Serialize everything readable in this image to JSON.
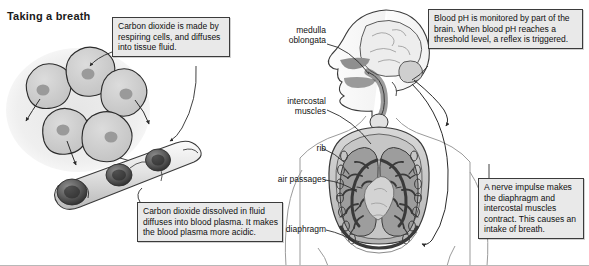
{
  "figure": {
    "title": "Taking a breath",
    "topic": "human breathing reflex and carbon dioxide transport",
    "style": "grayscale textbook illustration"
  },
  "callouts": [
    {
      "id": "co2-cells",
      "text": "Carbon dioxide is made by respiring cells, and diffuses into tissue fluid.",
      "points_to": "respiring-tissue-cells"
    },
    {
      "id": "blood-ph",
      "text": "Blood pH is monitored by part of the brain. When blood pH reaches a threshold level, a reflex is triggered.",
      "points_to": "medulla-oblongata"
    },
    {
      "id": "co2-plasma",
      "text": "Carbon dioxide dissolved in fluid diffuses into blood plasma. It makes the blood plasma more acidic.",
      "points_to": "blood-vessel"
    },
    {
      "id": "nerve-impulse",
      "text": "A nerve impulse makes the diaphragm and intercostal muscles contract. This causes an intake of breath.",
      "points_to": "diaphragm-and-intercostal-muscles"
    }
  ],
  "anatomy_labels": [
    {
      "id": "medulla",
      "text": "medulla\noblongata"
    },
    {
      "id": "intercostal",
      "text": "intercostal\nmuscles"
    },
    {
      "id": "rib",
      "text": "rib"
    },
    {
      "id": "air-passages",
      "text": "air passages"
    },
    {
      "id": "diaphragm",
      "text": "diaphragm"
    }
  ],
  "illustrations": [
    {
      "id": "tissue-cells",
      "description": "cluster of five respiring cells with nuclei in tissue fluid, arrows showing carbon dioxide diffusing out"
    },
    {
      "id": "blood-vessel",
      "description": "cutaway blood vessel containing red blood cells"
    },
    {
      "id": "human-torso",
      "description": "human head and torso in profile showing brain, nasal cavity, trachea, ribs, lungs, heart and diaphragm"
    }
  ],
  "colors": {
    "callout_fill": "#e9e9e9",
    "callout_border": "#3b3b3b",
    "ink": "#2b2b2b",
    "cell_fill": "#cfcfcf",
    "nucleus_fill": "#9a9a9a",
    "tissue_fluid": "#ededed",
    "lung_dark": "#4a4a4a",
    "page_background": "#ffffff"
  }
}
